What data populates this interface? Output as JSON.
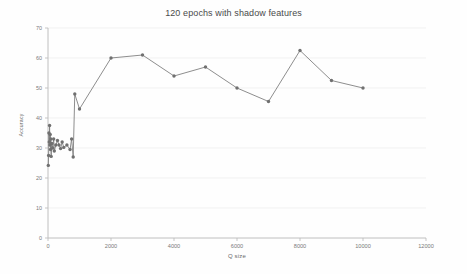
{
  "chart_data": {
    "type": "line",
    "title": "120 epochs with shadow features",
    "xlabel": "Q size",
    "ylabel": "Accuracy",
    "xlim": [
      0,
      12000
    ],
    "ylim": [
      0,
      70
    ],
    "grid": true,
    "legend": false,
    "line_color": "#808080",
    "marker_color": "#707070",
    "x_ticks": [
      0,
      2000,
      4000,
      6000,
      8000,
      10000,
      12000
    ],
    "x_tick_labels": [
      "0",
      "2000",
      "4000",
      "6000",
      "8000",
      "10000",
      "12000"
    ],
    "y_ticks": [
      0,
      10,
      20,
      30,
      40,
      50,
      60,
      70
    ],
    "y_tick_labels": [
      "0",
      "10",
      "20",
      "30",
      "40",
      "50",
      "60",
      "70"
    ],
    "series": [
      {
        "name": "accuracy",
        "points": [
          [
            10,
            24.2
          ],
          [
            20,
            27.5
          ],
          [
            30,
            35.0
          ],
          [
            40,
            32.0
          ],
          [
            50,
            37.5
          ],
          [
            60,
            31.0
          ],
          [
            70,
            34.5
          ],
          [
            80,
            29.5
          ],
          [
            90,
            33.0
          ],
          [
            100,
            27.2
          ],
          [
            120,
            31.5
          ],
          [
            150,
            30.0
          ],
          [
            180,
            33.0
          ],
          [
            200,
            29.0
          ],
          [
            250,
            31.0
          ],
          [
            300,
            32.5
          ],
          [
            350,
            31.0
          ],
          [
            400,
            29.8
          ],
          [
            450,
            32.0
          ],
          [
            500,
            30.2
          ],
          [
            600,
            31.0
          ],
          [
            700,
            29.5
          ],
          [
            750,
            33.0
          ],
          [
            800,
            27.0
          ],
          [
            850,
            48.0
          ],
          [
            1000,
            43.0
          ],
          [
            2000,
            60.0
          ],
          [
            3000,
            61.0
          ],
          [
            4000,
            54.0
          ],
          [
            5000,
            57.0
          ],
          [
            6000,
            50.0
          ],
          [
            7000,
            45.5
          ],
          [
            8000,
            62.5
          ],
          [
            9000,
            52.5
          ],
          [
            10000,
            50.0
          ]
        ]
      }
    ]
  },
  "plot": {
    "left": 48,
    "right": 426,
    "top": 28,
    "bottom": 238
  }
}
